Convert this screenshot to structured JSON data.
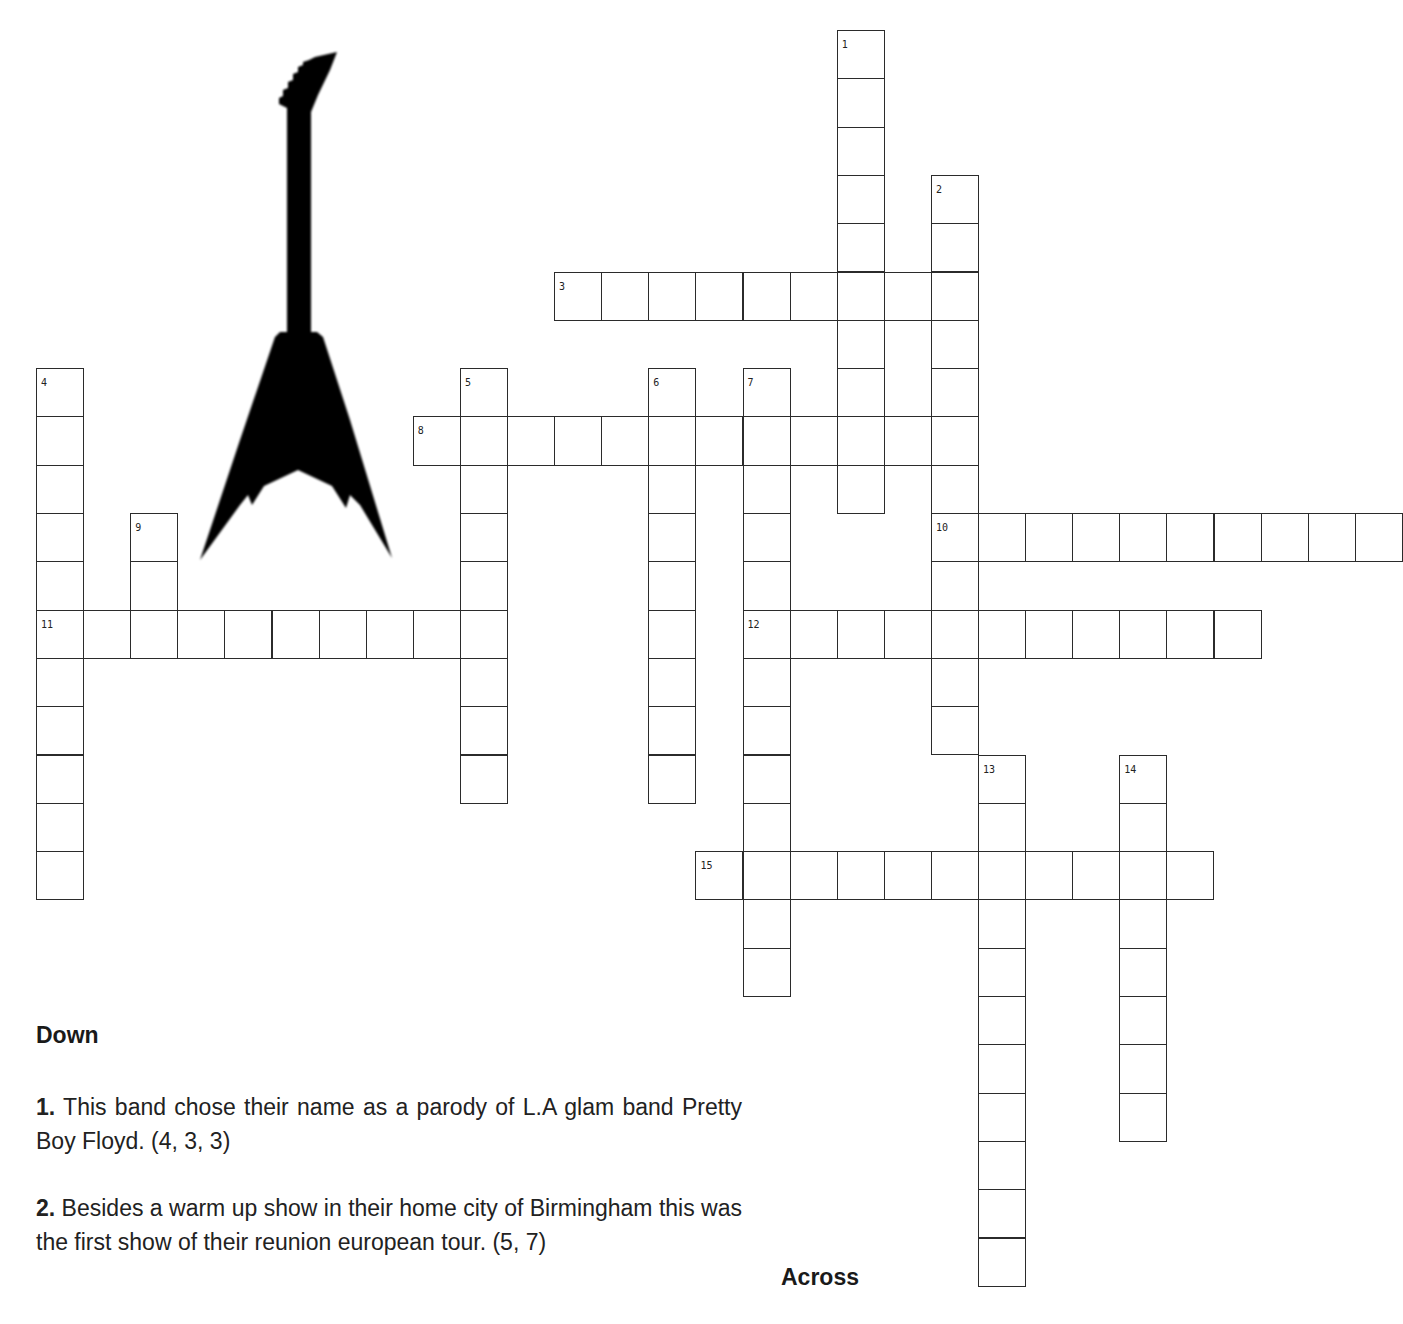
{
  "puzzle": {
    "grid": {
      "origin_x": 36,
      "origin_y": 30,
      "cell_w": 47.1,
      "cell_h": 48.3,
      "entries": [
        {
          "number": "1",
          "dir": "down",
          "col": 17,
          "row": 0,
          "length": 10
        },
        {
          "number": "2",
          "dir": "down",
          "col": 19,
          "row": 3,
          "length": 12
        },
        {
          "number": "3",
          "dir": "across",
          "col": 11,
          "row": 5,
          "length": 9
        },
        {
          "number": "4",
          "dir": "down",
          "col": 0,
          "row": 7,
          "length": 11
        },
        {
          "number": "5",
          "dir": "down",
          "col": 9,
          "row": 7,
          "length": 9
        },
        {
          "number": "6",
          "dir": "down",
          "col": 13,
          "row": 7,
          "length": 9
        },
        {
          "number": "7",
          "dir": "down",
          "col": 15,
          "row": 7,
          "length": 13
        },
        {
          "number": "8",
          "dir": "across",
          "col": 8,
          "row": 8,
          "length": 12
        },
        {
          "number": "9",
          "dir": "down",
          "col": 2,
          "row": 10,
          "length": 3
        },
        {
          "number": "10",
          "dir": "across",
          "col": 19,
          "row": 10,
          "length": 10
        },
        {
          "number": "11",
          "dir": "across",
          "col": 0,
          "row": 12,
          "length": 10
        },
        {
          "number": "12",
          "dir": "across",
          "col": 15,
          "row": 12,
          "length": 11
        },
        {
          "number": "13",
          "dir": "down",
          "col": 20,
          "row": 15,
          "length": 11
        },
        {
          "number": "14",
          "dir": "down",
          "col": 23,
          "row": 15,
          "length": 8
        },
        {
          "number": "15",
          "dir": "across",
          "col": 14,
          "row": 17,
          "length": 11
        }
      ]
    },
    "image": {
      "icon": "flying-v-guitar-icon",
      "color": "#000000"
    },
    "clues": {
      "down_heading": "Down",
      "across_heading": "Across",
      "down": [
        {
          "number": "1.",
          "text": " This band chose their name as a parody of L.A glam band Pretty Boy Floyd. (4, 3, 3)"
        },
        {
          "number": "2.",
          "text": " Besides a warm up show in their home city of Birmingham this was the first show of their reunion european tour. (5, 7)"
        }
      ]
    }
  }
}
